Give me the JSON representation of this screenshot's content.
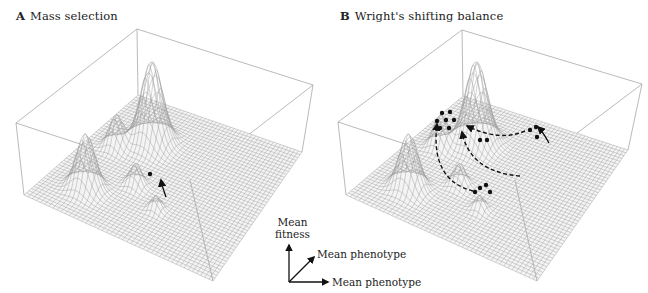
{
  "panels": [
    {
      "letter": "A",
      "title": "Mass selection",
      "box": {
        "top_back": [
          137,
          29
        ],
        "top_left": [
          16,
          123
        ],
        "top_right": [
          313,
          85
        ],
        "top_front": [
          190,
          180
        ],
        "base_back": [
          138,
          95
        ],
        "base_left": [
          24,
          195
        ],
        "base_right": [
          302,
          152
        ],
        "base_front": [
          213,
          281
        ]
      },
      "peaks": [
        {
          "u": 0.28,
          "v": 0.3,
          "h": 82,
          "w": 0.055
        },
        {
          "u": 0.2,
          "v": 0.78,
          "h": 55,
          "w": 0.045
        },
        {
          "u": 0.38,
          "v": 0.62,
          "h": 22,
          "w": 0.03
        },
        {
          "u": 0.15,
          "v": 0.42,
          "h": 32,
          "w": 0.035
        },
        {
          "u": 0.55,
          "v": 0.72,
          "h": 14,
          "w": 0.025
        }
      ],
      "points": [
        [
          150,
          174
        ]
      ],
      "arrows": [
        {
          "path": "M166,197 Q162,186 161,180",
          "dashed": false
        }
      ]
    },
    {
      "letter": "B",
      "title": "Wright's shifting balance",
      "box": {
        "top_back": [
          462,
          30
        ],
        "top_left": [
          338,
          122
        ],
        "top_right": [
          642,
          84
        ],
        "top_front": [
          515,
          180
        ],
        "base_back": [
          463,
          96
        ],
        "base_left": [
          346,
          195
        ],
        "base_right": [
          628,
          150
        ],
        "base_front": [
          537,
          281
        ]
      },
      "peaks": [
        {
          "u": 0.28,
          "v": 0.3,
          "h": 82,
          "w": 0.055
        },
        {
          "u": 0.2,
          "v": 0.78,
          "h": 55,
          "w": 0.045
        },
        {
          "u": 0.38,
          "v": 0.62,
          "h": 22,
          "w": 0.03
        },
        {
          "u": 0.15,
          "v": 0.42,
          "h": 32,
          "w": 0.035
        },
        {
          "u": 0.55,
          "v": 0.72,
          "h": 14,
          "w": 0.025
        }
      ],
      "points": [
        [
          442,
          113
        ],
        [
          450,
          112
        ],
        [
          437,
          121
        ],
        [
          446,
          120
        ],
        [
          454,
          120
        ],
        [
          440,
          128
        ],
        [
          449,
          128
        ],
        [
          480,
          140
        ],
        [
          487,
          140
        ],
        [
          530,
          130
        ],
        [
          536,
          127
        ],
        [
          537,
          137
        ],
        [
          480,
          188
        ],
        [
          486,
          185
        ],
        [
          490,
          192
        ],
        [
          475,
          192
        ]
      ],
      "arrows": [
        {
          "path": "M549,143 Q543,132 538,127",
          "dashed": false
        },
        {
          "path": "M525,131 Q500,142 467,126",
          "dashed": true
        },
        {
          "path": "M520,176 Q470,172 462,132",
          "dashed": true
        },
        {
          "path": "M473,191 Q430,180 437,124",
          "dashed": true
        }
      ]
    }
  ],
  "legend": {
    "z_label_line1": "Mean",
    "z_label_line2": "fitness",
    "y_label": "Mean phenotype",
    "x_label": "Mean phenotype"
  },
  "colors": {
    "grid": "#9a9a9a",
    "box": "#a8a8a8",
    "ink": "#111111"
  }
}
